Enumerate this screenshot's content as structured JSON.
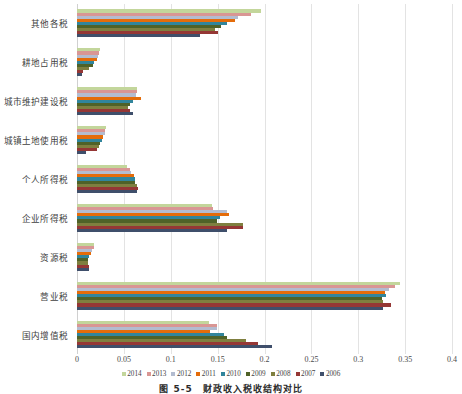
{
  "chart_data": {
    "type": "bar",
    "orientation": "horizontal",
    "title": "",
    "xlabel": "",
    "ylabel": "",
    "xlim": [
      0,
      0.4
    ],
    "xticks": [
      "0",
      "0.05",
      "0.1",
      "0.15",
      "0.2",
      "0.25",
      "0.3",
      "0.35",
      "0.4"
    ],
    "xtick_values": [
      0,
      0.05,
      0.1,
      0.15,
      0.2,
      0.25,
      0.3,
      0.35,
      0.4
    ],
    "grid": true,
    "grid_axis": "x",
    "legend_position": "bottom",
    "categories": [
      "其他各税",
      "耕地占用税",
      "城市维护建设税",
      "城镇土地使用税",
      "个人所得税",
      "企业所得税",
      "资源税",
      "营业税",
      "国内增值税"
    ],
    "series": [
      {
        "name": "2014",
        "color": "#c3d69b",
        "values": [
          0.196,
          0.0245,
          0.0635,
          0.031,
          0.0535,
          0.1445,
          0.0185,
          0.345,
          0.1405
        ]
      },
      {
        "name": "2013",
        "color": "#d99694",
        "values": [
          0.186,
          0.023,
          0.064,
          0.03,
          0.056,
          0.1455,
          0.018,
          0.339,
          0.1495
        ]
      },
      {
        "name": "2012",
        "color": "#b3bcd0",
        "values": [
          0.172,
          0.0225,
          0.0625,
          0.0295,
          0.058,
          0.1605,
          0.0165,
          0.333,
          0.1495
        ]
      },
      {
        "name": "2011",
        "color": "#e46c0a",
        "values": [
          0.168,
          0.021,
          0.068,
          0.028,
          0.061,
          0.162,
          0.015,
          0.328,
          0.142
        ]
      },
      {
        "name": "2010",
        "color": "#31859c",
        "values": [
          0.16,
          0.0185,
          0.06,
          0.027,
          0.062,
          0.152,
          0.0125,
          0.33,
          0.1565
        ]
      },
      {
        "name": "2009",
        "color": "#4f6228",
        "values": [
          0.154,
          0.0175,
          0.0565,
          0.025,
          0.062,
          0.149,
          0.0118,
          0.3255,
          0.1605
        ]
      },
      {
        "name": "2008",
        "color": "#7f7f3f",
        "values": [
          0.147,
          0.013,
          0.0545,
          0.0235,
          0.0635,
          0.1775,
          0.0112,
          0.326,
          0.1805
        ]
      },
      {
        "name": "2007",
        "color": "#953735",
        "values": [
          0.15,
          0.0062,
          0.0565,
          0.0215,
          0.0655,
          0.177,
          0.013,
          0.3345,
          0.193
        ]
      },
      {
        "name": "2006",
        "color": "#3f4f6b",
        "values": [
          0.131,
          0.005,
          0.0595,
          0.01,
          0.0645,
          0.16,
          0.0128,
          0.3265,
          0.2075
        ]
      }
    ]
  },
  "legend": {
    "items": [
      "2014",
      "2013",
      "2012",
      "2011",
      "2010",
      "2009",
      "2008",
      "2007",
      "2006"
    ]
  },
  "caption": {
    "text": "图 5-5　财政收入税收结构对比"
  }
}
